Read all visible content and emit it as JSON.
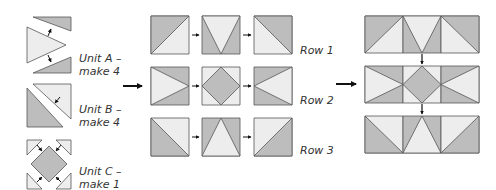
{
  "colors": {
    "dark": "#bdbdbd",
    "light": "#ededed",
    "stroke": "#555555",
    "arrow": "#111111",
    "text": "#333333"
  },
  "units": [
    {
      "name": "Unit A",
      "line1": "Unit A –",
      "line2": "make 4"
    },
    {
      "name": "Unit B",
      "line1": "Unit B –",
      "line2": "make 4"
    },
    {
      "name": "Unit C",
      "line1": "Unit C –",
      "line2": "make 1"
    }
  ],
  "rows": [
    {
      "label": "Row 1"
    },
    {
      "label": "Row 2"
    },
    {
      "label": "Row 3"
    }
  ]
}
